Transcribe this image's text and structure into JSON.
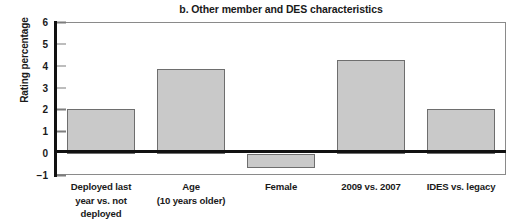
{
  "chart_data": {
    "type": "bar",
    "title": "b. Other member and DES characteristics",
    "xlabel": "",
    "ylabel": "Rating percentage",
    "categories": [
      "Deployed last\nyear vs. not\ndeployed",
      "Age\n(10 years older)",
      "Female",
      "2009 vs. 2007",
      "IDES vs. legacy"
    ],
    "values": [
      2.05,
      3.88,
      -0.62,
      4.3,
      2.05
    ],
    "ylim": [
      -1,
      6
    ],
    "yticks": [
      6,
      5,
      4,
      3,
      2,
      1,
      0,
      -1
    ],
    "ytick_labels": [
      "6",
      "5",
      "4",
      "3",
      "2",
      "1",
      "0",
      "−1"
    ],
    "grid": false,
    "legend": "none",
    "bar_fill_color": "#c9c9c9",
    "bar_edge_color": "#6e6e6e",
    "axis_color": "#111111",
    "zero_line": 0
  }
}
